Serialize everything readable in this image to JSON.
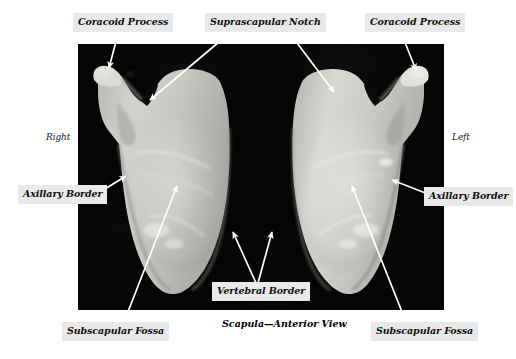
{
  "figure": {
    "caption": "Scapula—Anterior View",
    "background_color": "#ffffff",
    "plate_color": "#050505",
    "label_background": "#e9e9e9",
    "label_text_color": "#101010",
    "leader_color": "#ffffff",
    "bone_color": "#c9c9c4"
  },
  "orientation": {
    "right_label": "Right",
    "left_label": "Left"
  },
  "labels": {
    "coracoid_process_left": "Coracoid Process",
    "suprascapular_notch": "Suprascapular Notch",
    "coracoid_process_right": "Coracoid Process",
    "axillary_border_left": "Axillary Border",
    "axillary_border_right": "Axillary Border",
    "vertebral_border": "Vertebral Border",
    "subscapular_fossa_left": "Subscapular Fossa",
    "subscapular_fossa_right": "Subscapular Fossa"
  },
  "specimens": [
    {
      "name": "right-scapula",
      "side": "right",
      "view": "anterior"
    },
    {
      "name": "left-scapula",
      "side": "left",
      "view": "anterior"
    }
  ]
}
